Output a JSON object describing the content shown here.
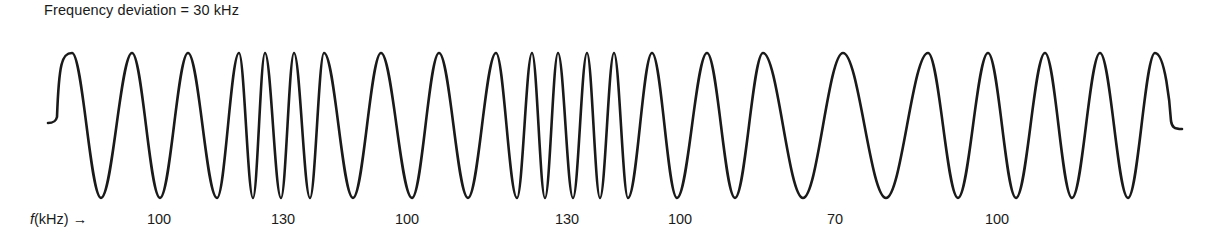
{
  "title": "Frequency deviation = 30 kHz",
  "axis_label": {
    "symbol": "f",
    "unit": "(kHz)",
    "arrow": "→"
  },
  "frequency_labels": [
    {
      "text": "100",
      "x": 159
    },
    {
      "text": "130",
      "x": 283
    },
    {
      "text": "100",
      "x": 407
    },
    {
      "text": "130",
      "x": 567
    },
    {
      "text": "100",
      "x": 680
    },
    {
      "text": "70",
      "x": 835
    },
    {
      "text": "100",
      "x": 997
    }
  ],
  "waveform": {
    "stroke_color": "#1a1a1a",
    "stroke_width": 2.6,
    "baseline_y": 125,
    "peak_y": 53,
    "trough_y": 198,
    "start": {
      "x": 48,
      "y": 123
    },
    "end": {
      "x": 1182,
      "y": 129
    },
    "extrema_x": [
      72,
      101,
      132,
      160,
      188,
      217,
      239,
      253,
      265,
      281,
      294,
      310,
      324,
      353,
      381,
      412,
      439,
      468,
      496,
      517,
      532,
      545,
      558,
      573,
      587,
      600,
      614,
      628,
      652,
      677,
      707,
      735,
      763,
      803,
      843,
      886,
      928,
      958,
      988,
      1016,
      1045,
      1072,
      1100,
      1128,
      1155
    ]
  },
  "chart_data": {
    "type": "line",
    "title": "Frequency deviation = 30 kHz",
    "xlabel": "f(kHz) →",
    "ylabel": "",
    "segments_khz": [
      100,
      130,
      100,
      130,
      100,
      70,
      100
    ],
    "carrier_khz": 100,
    "deviation_khz": 30,
    "grid": false
  }
}
